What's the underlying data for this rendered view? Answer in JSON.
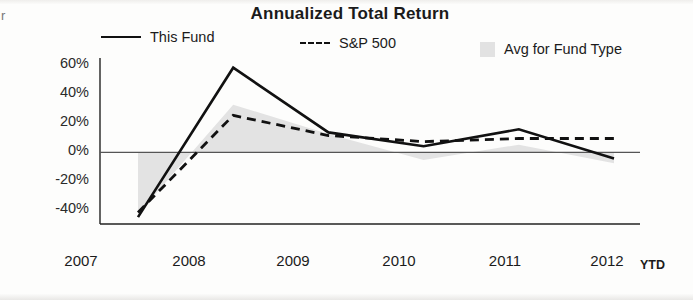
{
  "chart_data": {
    "type": "line",
    "title": "Annualized Total Return",
    "xlabel": "",
    "ylabel": "",
    "x": [
      "2007",
      "2008",
      "2009",
      "2010",
      "2011",
      "2012"
    ],
    "x_note": "YTD",
    "ylim": [
      -40,
      60
    ],
    "yticks": [
      60,
      40,
      20,
      0,
      -20,
      -40
    ],
    "ytick_labels": [
      "60%",
      "40%",
      "20%",
      "0%",
      "-20%",
      "-40%"
    ],
    "grid": false,
    "legend_position": "top",
    "series": [
      {
        "name": "This Fund",
        "style": "solid",
        "color": "#111111",
        "values": [
          -42,
          55,
          13,
          4,
          15,
          -4
        ]
      },
      {
        "name": "S&P 500",
        "style": "dashed",
        "color": "#111111",
        "values": [
          -39,
          24,
          11,
          7,
          9,
          9
        ]
      },
      {
        "name": "Avg for Fund Type",
        "style": "area",
        "color": "#e2e2e2",
        "values": [
          -40,
          31,
          12,
          -5,
          5,
          -7
        ]
      }
    ]
  },
  "legend": {
    "fund_label": "This Fund",
    "sp_label": "S&P 500",
    "avg_label": "Avg for Fund Type",
    "fund_swatch": "solid-line-swatch",
    "sp_swatch": "dashed-line-swatch",
    "avg_swatch": "gray-box-swatch"
  },
  "axis": {
    "y_tick_0": "60%",
    "y_tick_1": "40%",
    "y_tick_2": "20%",
    "y_tick_3": "0%",
    "y_tick_4": "-20%",
    "y_tick_5": "-40%",
    "x_tick_0": "2007",
    "x_tick_1": "2008",
    "x_tick_2": "2009",
    "x_tick_3": "2010",
    "x_tick_4": "2011",
    "x_tick_5": "2012",
    "ytd_note": "YTD"
  },
  "page": {
    "left_margin_mark": "r"
  }
}
